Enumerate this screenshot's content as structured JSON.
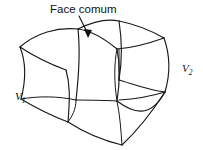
{
  "figure": {
    "title_annotation": "Face comum",
    "labels": {
      "left_volume": "V",
      "left_volume_subscript": "1",
      "right_volume": "V",
      "right_volume_subscript": "2"
    },
    "colors": {
      "stroke": "#1a1a1a",
      "background": "#ffffff",
      "text": "#111111"
    },
    "annotation": {
      "text": "Face comum",
      "arrow_name": "arrow-to-common-face",
      "arrow_direction": "down-left"
    },
    "geometry": {
      "description": "Two curved hexahedral control volumes sharing a common face",
      "cell_count": 2,
      "shared_face": true
    }
  }
}
